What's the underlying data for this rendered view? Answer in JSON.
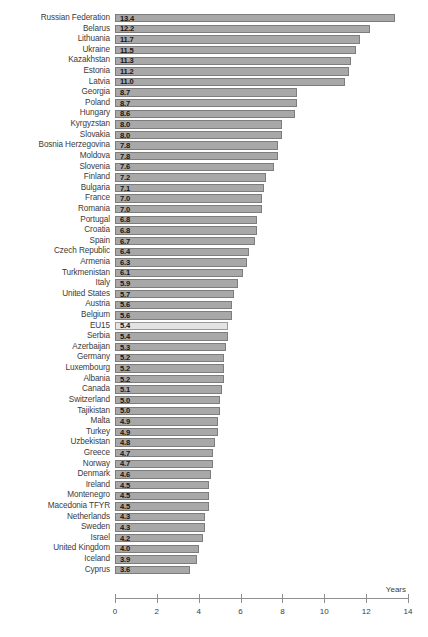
{
  "chart_data": {
    "type": "bar",
    "orientation": "horizontal",
    "title": "",
    "xlabel": "Years",
    "ylabel": "",
    "xlim": [
      0,
      14
    ],
    "xticks": [
      0,
      2,
      4,
      6,
      8,
      10,
      12,
      14
    ],
    "grid": false,
    "legend": null,
    "highlight_category": "EU15",
    "colors": {
      "bar_fill": "#a8a8a8",
      "bar_border": "#7d7d7d",
      "highlight_fill": "#e3e3e3",
      "highlight_border": "#9a9a9a",
      "text": "#3b3b3b",
      "background": "#ffffff"
    },
    "categories": [
      "Russian Federation",
      "Belarus",
      "Lithuania",
      "Ukraine",
      "Kazakhstan",
      "Estonia",
      "Latvia",
      "Georgia",
      "Poland",
      "Hungary",
      "Kyrgyzstan",
      "Slovakia",
      "Bosnia Herzegovina",
      "Moldova",
      "Slovenia",
      "Finland",
      "Bulgaria",
      "France",
      "Romania",
      "Portugal",
      "Croatia",
      "Spain",
      "Czech Republic",
      "Armenia",
      "Turkmenistan",
      "Italy",
      "United States",
      "Austria",
      "Belgium",
      "EU15",
      "Serbia",
      "Azerbaijan",
      "Germany",
      "Luxembourg",
      "Albania",
      "Canada",
      "Switzerland",
      "Tajikistan",
      "Malta",
      "Turkey",
      "Uzbekistan",
      "Greece",
      "Norway",
      "Denmark",
      "Ireland",
      "Montenegro",
      "Macedonia TFYR",
      "Netherlands",
      "Sweden",
      "Israel",
      "United Kingdom",
      "Iceland",
      "Cyprus"
    ],
    "values": [
      13.4,
      12.2,
      11.7,
      11.5,
      11.3,
      11.2,
      11.0,
      8.7,
      8.7,
      8.6,
      8.0,
      8.0,
      7.8,
      7.8,
      7.6,
      7.2,
      7.1,
      7.0,
      7.0,
      6.8,
      6.8,
      6.7,
      6.4,
      6.3,
      6.1,
      5.9,
      5.7,
      5.6,
      5.6,
      5.4,
      5.4,
      5.3,
      5.2,
      5.2,
      5.2,
      5.1,
      5.0,
      5.0,
      4.9,
      4.9,
      4.8,
      4.7,
      4.7,
      4.6,
      4.5,
      4.5,
      4.5,
      4.3,
      4.3,
      4.2,
      4.0,
      3.9,
      3.6
    ],
    "value_labels": [
      "13.4",
      "12.2",
      "11.7",
      "11.5",
      "11.3",
      "11.2",
      "11.0",
      "8.7",
      "8.7",
      "8.6",
      "8.0",
      "8.0",
      "7.8",
      "7.8",
      "7.6",
      "7.2",
      "7.1",
      "7.0",
      "7.0",
      "6.8",
      "6.8",
      "6.7",
      "6.4",
      "6.3",
      "6.1",
      "5.9",
      "5.7",
      "5.6",
      "5.6",
      "5.4",
      "5.4",
      "5.3",
      "5.2",
      "5.2",
      "5.2",
      "5.1",
      "5.0",
      "5.0",
      "4.9",
      "4.9",
      "4.8",
      "4.7",
      "4.7",
      "4.6",
      "4.5",
      "4.5",
      "4.5",
      "4.3",
      "4.3",
      "4.2",
      "4.0",
      "3.9",
      "3.6"
    ],
    "xtick_labels": [
      "0",
      "2",
      "4",
      "6",
      "8",
      "10",
      "12",
      "14"
    ]
  }
}
